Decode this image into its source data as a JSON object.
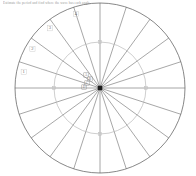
{
  "header": {
    "instruction": "Estimate the period and find where the wave has each angle."
  },
  "figure": {
    "name": "polar-spoke-diagram",
    "center": {
      "x": 100,
      "y": 88
    },
    "outer_circle": {
      "radius": 85,
      "color": "#555555",
      "stroke_width": 0.7
    },
    "inner_circle": {
      "radius": 46,
      "color": "#b9b9b9",
      "stroke_width": 0.7
    },
    "spoke_color": "#5d5d5d",
    "spoke_width": 0.55,
    "spoke_count": 20,
    "spoke_angles_deg": [
      0,
      18,
      36,
      54,
      72,
      90,
      108,
      126,
      144,
      162,
      180,
      198,
      216,
      234,
      252,
      270,
      288,
      306,
      324,
      342
    ],
    "center_dot": {
      "size": 4.5,
      "color": "#1c1c1c"
    },
    "outer_tick_labels": [
      {
        "text": "1",
        "angle_deg": 168,
        "radius": 78
      },
      {
        "text": "2",
        "angle_deg": 150,
        "radius": 78
      },
      {
        "text": "3",
        "angle_deg": 130,
        "radius": 78
      },
      {
        "text": "4",
        "angle_deg": 108,
        "radius": 78
      }
    ],
    "center_marks": [
      {
        "text": "A",
        "dx": -14,
        "dy": -13
      },
      {
        "text": "B",
        "dx": -10,
        "dy": -9
      },
      {
        "text": "C",
        "dx": -13,
        "dy": -5
      },
      {
        "text": "D",
        "dx": -16,
        "dy": -1
      }
    ],
    "inner_ticks": [
      {
        "angle_deg": 0,
        "radius": 46
      },
      {
        "angle_deg": 90,
        "radius": 46
      },
      {
        "angle_deg": 180,
        "radius": 46
      },
      {
        "angle_deg": 270,
        "radius": 46
      }
    ]
  }
}
